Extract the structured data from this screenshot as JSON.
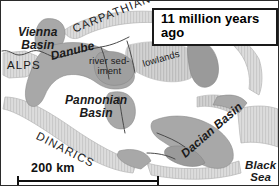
{
  "map": {
    "title": "11 million years ago",
    "scale": {
      "label": "200 km"
    },
    "colors": {
      "background": "#ffffff",
      "mountain_belt": "#d9d9d9",
      "mountain_belt_hatch": "#c4c4c4",
      "sediment": "#a8a8a8",
      "sediment_dark": "#9a9a9a",
      "basin_water": "#ffffff",
      "outline": "#6e6e6e",
      "river": "#4a4a4a",
      "frame": "#2b2b2b",
      "text": "#1a1a1a"
    },
    "labels": [
      {
        "id": "vienna-basin",
        "line1": "Vienna",
        "line2": "Basin",
        "style": "italic",
        "rotation": 0
      },
      {
        "id": "alps",
        "text": "ALPS",
        "style": "caps",
        "rotation": 0
      },
      {
        "id": "carpathians",
        "text": "CARPATHIANS",
        "style": "caps",
        "rotation": -22
      },
      {
        "id": "danube",
        "text": "Danube",
        "style": "italic",
        "rotation": -14
      },
      {
        "id": "river-sediment",
        "line1": "river sed-",
        "line2": "iment",
        "style": "plain",
        "rotation": 0
      },
      {
        "id": "lowlands",
        "text": "lowlands",
        "style": "plain",
        "rotation": -16
      },
      {
        "id": "pannonian-basin",
        "line1": "Pannonian",
        "line2": "Basin",
        "style": "italic",
        "rotation": 0
      },
      {
        "id": "dinarics",
        "text": "DINARICS",
        "style": "caps",
        "rotation": 27
      },
      {
        "id": "dacian-basin",
        "text": "Dacian Basin",
        "style": "italic",
        "rotation": -41
      },
      {
        "id": "black-sea",
        "line1": "Black",
        "line2": "Sea",
        "style": "italic",
        "rotation": 0
      }
    ]
  }
}
